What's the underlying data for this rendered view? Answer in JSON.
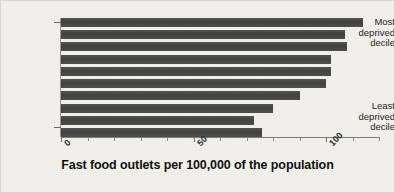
{
  "chart_data": {
    "type": "bar",
    "orientation": "horizontal",
    "title": "",
    "xlabel": "Fast food outlets per 100,000 of the population",
    "ylabel": "",
    "xlim": [
      0,
      120
    ],
    "xticks": [
      0,
      50,
      100
    ],
    "xtick_labels": [
      "0",
      "50",
      "100"
    ],
    "grid": false,
    "legend": null,
    "bar_color": "#4a4a4a",
    "background_color": "#f2f1ec",
    "categories": [
      "Most deprived decile",
      "Decile 2",
      "Decile 3",
      "Decile 4",
      "Decile 5",
      "Decile 6",
      "Decile 7",
      "Decile 8",
      "Decile 9",
      "Least deprived decile"
    ],
    "category_axis_labels": [
      {
        "text_lines": [
          "Most",
          "deprived",
          "decile"
        ],
        "position": "top"
      },
      {
        "text_lines": [
          "Least",
          "deprived",
          "decile"
        ],
        "position": "bottom"
      }
    ],
    "values": [
      114,
      107,
      108,
      102,
      102,
      100,
      90,
      80,
      73,
      76
    ]
  },
  "axis": {
    "x_tick_0": "0",
    "x_tick_50": "50",
    "x_tick_100": "100",
    "x_title": "Fast food outlets per 100,000 of the population",
    "y_top_line1": "Most",
    "y_top_line2": "deprived",
    "y_top_line3": "decile",
    "y_bottom_line1": "Least",
    "y_bottom_line2": "deprived",
    "y_bottom_line3": "decile"
  }
}
